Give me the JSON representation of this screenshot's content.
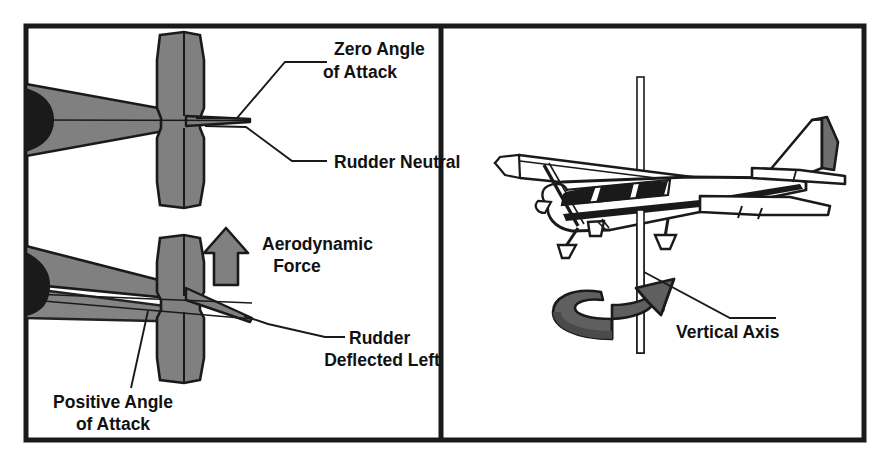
{
  "figure": {
    "frame_color": "#1a1a1a",
    "gray_fill": "#808080",
    "dark_fill": "#1a1a1a",
    "background": "#ffffff"
  },
  "left_panel": {
    "name": "rudder-top-view-panel",
    "top_diagram": {
      "name": "rudder-neutral-diagram",
      "labels": {
        "angle_of_attack_line1": "Zero Angle",
        "angle_of_attack_line2": "of Attack",
        "rudder_state": "Rudder Neutral"
      }
    },
    "bottom_diagram": {
      "name": "rudder-deflected-diagram",
      "labels": {
        "aerodynamic_force_line1": "Aerodynamic",
        "aerodynamic_force_line2": "Force",
        "rudder_state_line1": "Rudder",
        "rudder_state_line2": "Deflected Left",
        "angle_of_attack_line1": "Positive Angle",
        "angle_of_attack_line2": "of Attack"
      },
      "force_arrow": {
        "name": "aerodynamic-force-arrow",
        "direction": "up",
        "fill": "#808080"
      }
    }
  },
  "right_panel": {
    "name": "vertical-axis-panel",
    "labels": {
      "axis": "Vertical Axis"
    },
    "aircraft": {
      "name": "cessna-high-wing-aircraft",
      "view": "three-quarter-front-left",
      "rudder_fill": "#6e6e6e"
    },
    "rotation_arrow": {
      "name": "yaw-rotation-arrow",
      "direction": "clockwise-about-vertical-axis",
      "fill": "#5f5f5f"
    },
    "axis_line": {
      "name": "vertical-axis-line",
      "orientation": "vertical"
    }
  }
}
